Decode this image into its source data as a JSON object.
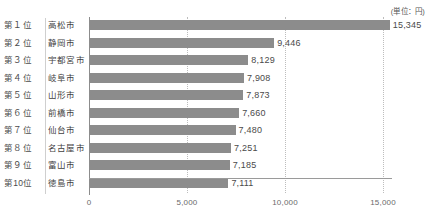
{
  "unit_caption": "(単位：円)",
  "axis": {
    "tick_labels": [
      "0",
      "5,000",
      "10,000",
      "15,000"
    ],
    "tick_values": [
      0,
      5000,
      10000,
      15000
    ]
  },
  "colors": {
    "bar": "#8c8c8c",
    "gridline": "#bdbdbd",
    "axis": "#8c8c8c",
    "text": "#4a4a4a",
    "background": "#ffffff"
  },
  "rows": [
    {
      "rank": "第１位",
      "city": "高松市",
      "value_label": "15,345",
      "value": 15345
    },
    {
      "rank": "第２位",
      "city": "静岡市",
      "value_label": "9,446",
      "value": 9446
    },
    {
      "rank": "第３位",
      "city": "宇都宮市",
      "value_label": "8,129",
      "value": 8129
    },
    {
      "rank": "第４位",
      "city": "岐阜市",
      "value_label": "7,908",
      "value": 7908
    },
    {
      "rank": "第５位",
      "city": "山形市",
      "value_label": "7,873",
      "value": 7873
    },
    {
      "rank": "第６位",
      "city": "前橋市",
      "value_label": "7,660",
      "value": 7660
    },
    {
      "rank": "第７位",
      "city": "仙台市",
      "value_label": "7,480",
      "value": 7480
    },
    {
      "rank": "第８位",
      "city": "名古屋市",
      "value_label": "7,251",
      "value": 7251
    },
    {
      "rank": "第９位",
      "city": "富山市",
      "value_label": "7,185",
      "value": 7185
    },
    {
      "rank": "第10位",
      "city": "徳島市",
      "value_label": "7,111",
      "value": 7111
    }
  ],
  "chart_data": {
    "type": "bar",
    "orientation": "horizontal",
    "title": "",
    "subtitle": "",
    "xlabel": "",
    "ylabel": "",
    "unit": "円",
    "unit_caption": "(単位：円)",
    "categories": [
      "高松市",
      "静岡市",
      "宇都宮市",
      "岐阜市",
      "山形市",
      "前橋市",
      "仙台市",
      "名古屋市",
      "富山市",
      "徳島市"
    ],
    "rank_labels": [
      "第１位",
      "第２位",
      "第３位",
      "第４位",
      "第５位",
      "第６位",
      "第７位",
      "第８位",
      "第９位",
      "第10位"
    ],
    "values": [
      15345,
      9446,
      8129,
      7908,
      7873,
      7660,
      7480,
      7251,
      7185,
      7111
    ],
    "data_labels": [
      "15,345",
      "9,446",
      "8,129",
      "7,908",
      "7,873",
      "7,660",
      "7,480",
      "7,251",
      "7,185",
      "7,111"
    ],
    "xlim": [
      0,
      15000
    ],
    "xticks": [
      0,
      5000,
      10000,
      15000
    ],
    "xtick_labels": [
      "0",
      "5,000",
      "10,000",
      "15,000"
    ],
    "grid": "vertical-dotted",
    "legend": "none",
    "bar_color": "#8c8c8c",
    "annotations": []
  }
}
